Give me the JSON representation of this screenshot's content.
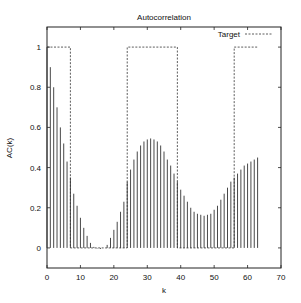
{
  "chart_data": {
    "type": "bar",
    "title": "Autocorrelation",
    "xlabel": "k",
    "ylabel": "AC(k)",
    "xlim": [
      0,
      70
    ],
    "ylim": [
      -0.1,
      1.1
    ],
    "xticks": [
      0,
      10,
      20,
      30,
      40,
      50,
      60,
      70
    ],
    "yticks": [
      0,
      0.2,
      0.4,
      0.6,
      0.8,
      1
    ],
    "grid": false,
    "legend_position": "top-right",
    "series": [
      {
        "name": "AC",
        "style": "impulses",
        "x": [
          0,
          1,
          2,
          3,
          4,
          5,
          6,
          7,
          8,
          9,
          10,
          11,
          12,
          13,
          14,
          15,
          16,
          17,
          18,
          19,
          20,
          21,
          22,
          23,
          24,
          25,
          26,
          27,
          28,
          29,
          30,
          31,
          32,
          33,
          34,
          35,
          36,
          37,
          38,
          39,
          40,
          41,
          42,
          43,
          44,
          45,
          46,
          47,
          48,
          49,
          50,
          51,
          52,
          53,
          54,
          55,
          56,
          57,
          58,
          59,
          60,
          61,
          62,
          63
        ],
        "values": [
          1.0,
          0.9,
          0.8,
          0.7,
          0.6,
          0.52,
          0.43,
          0.35,
          0.27,
          0.21,
          0.15,
          0.1,
          0.06,
          0.025,
          0.005,
          -0.003,
          -0.005,
          0.0,
          0.015,
          0.05,
          0.09,
          0.13,
          0.18,
          0.23,
          0.33,
          0.39,
          0.44,
          0.48,
          0.51,
          0.53,
          0.54,
          0.545,
          0.54,
          0.53,
          0.51,
          0.48,
          0.44,
          0.41,
          0.37,
          0.33,
          0.29,
          0.26,
          0.23,
          0.2,
          0.18,
          0.17,
          0.165,
          0.16,
          0.165,
          0.17,
          0.19,
          0.21,
          0.24,
          0.27,
          0.3,
          0.33,
          0.35,
          0.37,
          0.39,
          0.41,
          0.42,
          0.43,
          0.44,
          0.45
        ]
      },
      {
        "name": "Target",
        "style": "dashed-step",
        "x": [
          0,
          7,
          7,
          24,
          24,
          39,
          39,
          56,
          56,
          63
        ],
        "values": [
          1,
          1,
          0,
          0,
          1,
          1,
          0,
          0,
          1,
          1
        ]
      }
    ]
  }
}
